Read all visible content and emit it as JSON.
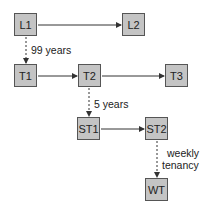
{
  "nodes": {
    "L1": {
      "label": "L1"
    },
    "L2": {
      "label": "L2"
    },
    "T1": {
      "label": "T1"
    },
    "T2": {
      "label": "T2"
    },
    "T3": {
      "label": "T3"
    },
    "ST1": {
      "label": "ST1"
    },
    "ST2": {
      "label": "ST2"
    },
    "WT": {
      "label": "WT"
    }
  },
  "edges": [
    {
      "from": "L1",
      "to": "L2",
      "style": "solid"
    },
    {
      "from": "L1",
      "to": "T1",
      "style": "dashed",
      "label": "99 years"
    },
    {
      "from": "T1",
      "to": "T2",
      "style": "solid"
    },
    {
      "from": "T2",
      "to": "T3",
      "style": "solid"
    },
    {
      "from": "T2",
      "to": "ST1",
      "style": "dashed",
      "label": "5 years"
    },
    {
      "from": "ST1",
      "to": "ST2",
      "style": "solid"
    },
    {
      "from": "ST2",
      "to": "WT",
      "style": "dashed",
      "label": "weekly tenancy"
    }
  ],
  "labels": {
    "l1_t1": "99 years",
    "t2_st1": "5 years",
    "st2_wt_line1": "weekly",
    "st2_wt_line2": "tenancy"
  },
  "colors": {
    "node_fill": "#c4c4c4",
    "node_border": "#555555",
    "line": "#333333"
  }
}
